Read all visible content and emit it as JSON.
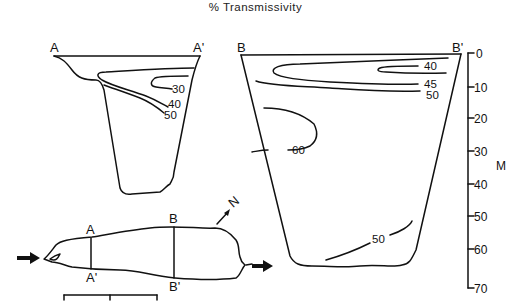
{
  "figure": {
    "title": "% Transmissivity"
  },
  "section_a": {
    "left_label": "A",
    "right_label": "A'",
    "contours": [
      "30",
      "40",
      "50"
    ]
  },
  "section_b": {
    "left_label": "B",
    "right_label": "B'",
    "contours": [
      "40",
      "45",
      "50",
      "60",
      "50"
    ]
  },
  "depth_axis": {
    "unit": "M",
    "ticks": [
      "0",
      "10",
      "20",
      "30",
      "40",
      "50",
      "60",
      "70"
    ]
  },
  "map": {
    "north_label": "N",
    "section_labels": {
      "a_top": "A",
      "a_bottom": "A'",
      "b_top": "B",
      "b_bottom": "B'"
    }
  }
}
